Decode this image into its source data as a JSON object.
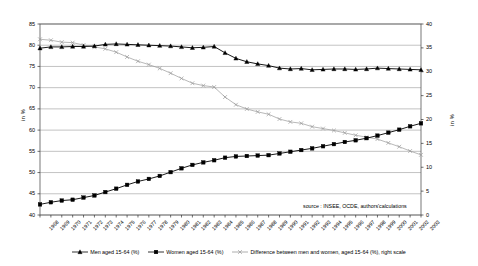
{
  "chart_data": {
    "type": "line",
    "title": "",
    "xlabel": "",
    "ylabel": "in %",
    "ylabel_right": "in %",
    "ylim": [
      40,
      85
    ],
    "ylim_right": [
      0,
      40
    ],
    "yticks": [
      40,
      45,
      50,
      55,
      60,
      65,
      70,
      75,
      80,
      85
    ],
    "yticks_right": [
      0,
      5,
      10,
      15,
      20,
      25,
      30,
      35,
      40
    ],
    "grid": true,
    "legend_position": "bottom",
    "annotation": "source : INSEE, OCDE, authors'calculations",
    "x": [
      1968,
      1969,
      1970,
      1971,
      1972,
      1973,
      1974,
      1975,
      1976,
      1977,
      1978,
      1979,
      1980,
      1981,
      1982,
      1983,
      1984,
      1985,
      1986,
      1987,
      1988,
      1989,
      1990,
      1991,
      1992,
      1993,
      1994,
      1995,
      1996,
      1997,
      1998,
      1999,
      2000,
      2001,
      2002,
      2003
    ],
    "categories": [
      "1968",
      "1969",
      "1970",
      "1971",
      "1972",
      "1973",
      "1974",
      "1975",
      "1976",
      "1977",
      "1978",
      "1979",
      "1980",
      "1981",
      "1982",
      "1983",
      "1984",
      "1985",
      "1986",
      "1987",
      "1988",
      "1989",
      "1990",
      "1991",
      "1992",
      "1993",
      "1994",
      "1995",
      "1996",
      "1997",
      "1998",
      "1999",
      "2000",
      "2001",
      "2002",
      "2003"
    ],
    "series": [
      {
        "name": "Men aged 15-64 (%)",
        "axis": "left",
        "marker": "triangle",
        "color": "#000000",
        "values": [
          79.3,
          79.6,
          79.6,
          79.7,
          79.7,
          79.8,
          80.2,
          80.3,
          80.2,
          80.1,
          80.0,
          79.9,
          79.8,
          79.6,
          79.4,
          79.5,
          79.7,
          78.2,
          76.9,
          76.1,
          75.6,
          75.2,
          74.6,
          74.4,
          74.5,
          74.2,
          74.3,
          74.4,
          74.4,
          74.3,
          74.4,
          74.6,
          74.5,
          74.4,
          74.3,
          74.2
        ]
      },
      {
        "name": "Women aged 15-64 (%)",
        "axis": "left",
        "marker": "square",
        "color": "#000000",
        "values": [
          42.5,
          43.0,
          43.4,
          43.6,
          44.1,
          44.6,
          45.4,
          46.2,
          47.1,
          47.9,
          48.5,
          49.2,
          50.1,
          51.0,
          51.8,
          52.4,
          52.9,
          53.5,
          53.8,
          53.9,
          54.0,
          54.1,
          54.5,
          54.9,
          55.3,
          55.7,
          56.2,
          56.7,
          57.2,
          57.6,
          58.1,
          58.7,
          59.4,
          60.1,
          60.9,
          61.6
        ]
      },
      {
        "name": "Difference between men and women, aged 15-64 (%), right scale",
        "axis": "right",
        "marker": "x",
        "color": "#999999",
        "values": [
          36.8,
          36.6,
          36.2,
          36.1,
          35.6,
          35.2,
          34.8,
          34.1,
          33.1,
          32.2,
          31.5,
          30.7,
          29.7,
          28.6,
          27.6,
          27.1,
          26.8,
          24.7,
          23.1,
          22.2,
          21.6,
          21.1,
          20.1,
          19.5,
          19.2,
          18.5,
          18.1,
          17.7,
          17.2,
          16.7,
          16.3,
          15.9,
          15.1,
          14.3,
          13.4,
          12.6
        ]
      }
    ]
  },
  "legend": {
    "items": [
      {
        "label": "Men aged 15-64 (%)",
        "marker": "triangle",
        "color": "#000000"
      },
      {
        "label": "Women aged 15-64 (%)",
        "marker": "square",
        "color": "#000000"
      },
      {
        "label": "Difference between men and women, aged 15-64 (%), right scale",
        "marker": "x",
        "color": "#999999"
      }
    ]
  }
}
